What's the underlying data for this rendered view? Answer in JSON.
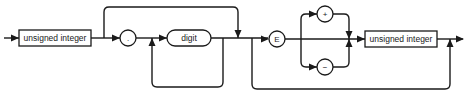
{
  "diagram": {
    "type": "syntax-railroad-diagram",
    "nodes": {
      "box1": {
        "label": "unsigned integer",
        "kind": "nonterminal"
      },
      "dot": {
        "label": ".",
        "kind": "terminal"
      },
      "digit": {
        "label": "digit",
        "kind": "nonterminal-rounded"
      },
      "e": {
        "label": "E",
        "kind": "terminal"
      },
      "plus": {
        "label": "+",
        "kind": "terminal"
      },
      "minus": {
        "label": "−",
        "kind": "terminal"
      },
      "box2": {
        "label": "unsigned integer",
        "kind": "nonterminal"
      }
    },
    "paths": [
      "entry → unsigned integer",
      "unsigned integer → . → digit (repeatable)",
      "unsigned integer → bypass fraction part",
      "→ E → [+ | − | none] → unsigned integer → exit",
      "→ bypass exponent part → exit"
    ],
    "colors": {
      "stroke": "#1a1a1a",
      "background": "#ffffff"
    }
  }
}
